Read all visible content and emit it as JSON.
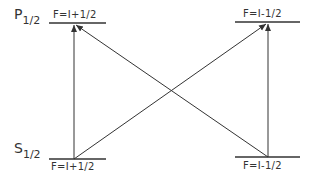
{
  "diagram": {
    "levels": [
      {
        "id": "p_plus",
        "state": "P",
        "state_sub": "1/2",
        "label": "F=I+1/2",
        "x1": 49,
        "x2": 106,
        "y": 23
      },
      {
        "id": "p_minus",
        "state": "",
        "state_sub": "",
        "label": "F=I-1/2",
        "x1": 235,
        "x2": 300,
        "y": 22
      },
      {
        "id": "s_plus",
        "state": "S",
        "state_sub": "1/2",
        "label": "F=I+1/2",
        "x1": 49,
        "x2": 106,
        "y": 159
      },
      {
        "id": "s_minus",
        "state": "",
        "state_sub": "",
        "label": "F=I-1/2",
        "x1": 235,
        "x2": 300,
        "y": 157
      }
    ],
    "transitions": [
      {
        "from": "s_plus",
        "to": "p_plus"
      },
      {
        "from": "s_plus",
        "to": "p_minus"
      },
      {
        "from": "s_minus",
        "to": "p_plus"
      },
      {
        "from": "s_minus",
        "to": "p_minus"
      }
    ],
    "line_color": "#333333"
  }
}
